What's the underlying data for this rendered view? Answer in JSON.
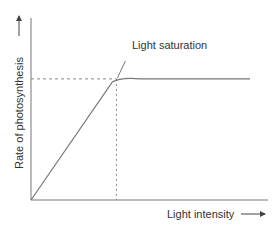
{
  "chart_data": {
    "type": "line",
    "title": "",
    "xlabel": "Light intensity",
    "ylabel": "Rate of photosynthesis",
    "annotation": "Light saturation",
    "xlim": [
      0,
      1
    ],
    "ylim": [
      0,
      1
    ],
    "series": [
      {
        "name": "Photosynthesis rate",
        "x": [
          0,
          0.37,
          0.42,
          0.5,
          1.0
        ],
        "y": [
          0,
          0.68,
          0.7,
          0.7,
          0.7
        ]
      }
    ],
    "saturation_point": {
      "x": 0.39,
      "y": 0.7
    },
    "grid": false,
    "colors": {
      "line": "#777777",
      "axis": "#777777",
      "dash": "#888888"
    }
  }
}
